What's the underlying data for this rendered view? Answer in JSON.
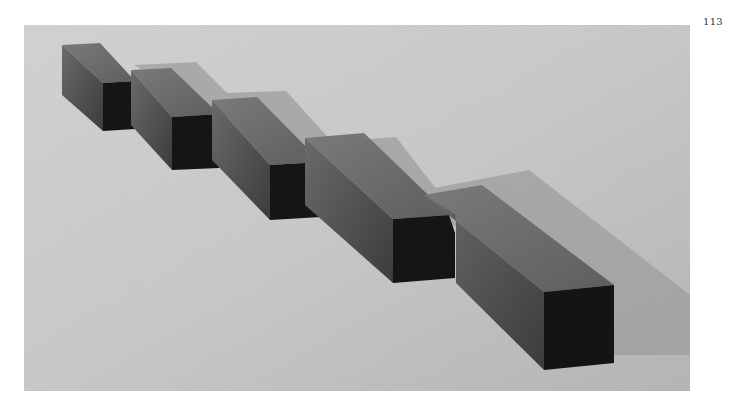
{
  "page": {
    "number": "113"
  },
  "photo": {
    "subject": "five-rectangular-boxes-in-diagonal-row",
    "box_count": 5,
    "colors": {
      "floor_light": "#d4d4d4",
      "floor_dark": "#b8b8b8",
      "shadow": "#9a9a9a",
      "box_top": "#6e6e6e",
      "box_side": "#5a5a5a",
      "box_front": "#151515"
    }
  }
}
